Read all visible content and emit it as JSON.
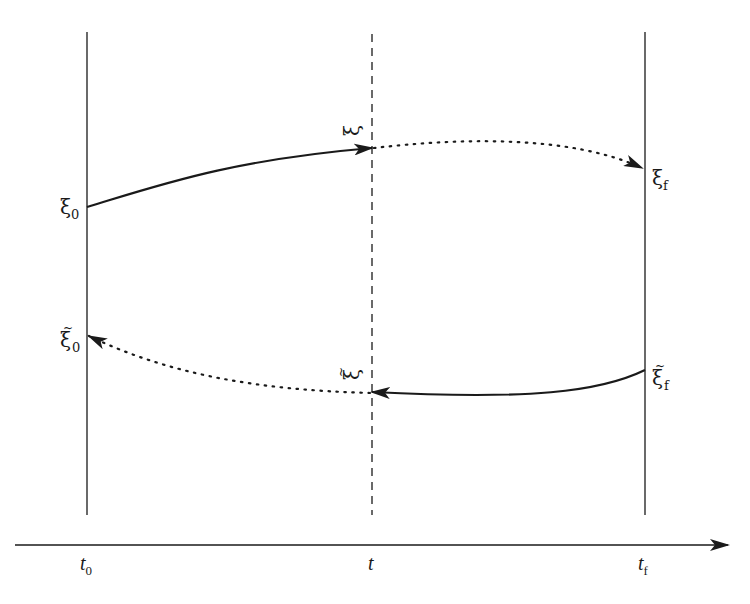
{
  "diagram": {
    "type": "forward-backward time evolution diagram",
    "time_axis": {
      "labels": {
        "start": "t",
        "start_sub": "0",
        "middle": "t",
        "end": "t",
        "end_sub": "f"
      }
    },
    "vertical_lines": [
      {
        "id": "t0-line",
        "style": "solid"
      },
      {
        "id": "t-line",
        "style": "dashed"
      },
      {
        "id": "tf-line",
        "style": "solid"
      }
    ],
    "state_labels": {
      "xi_0": {
        "symbol": "ξ",
        "sub": "0"
      },
      "xi_mid": {
        "symbol": "ξ"
      },
      "xi_f": {
        "symbol": "ξ",
        "sub": "f"
      },
      "xi_tilde_0": {
        "symbol": "ξ̃",
        "base": "ξ",
        "accent": "~",
        "sub": "0"
      },
      "xi_tilde_mid": {
        "symbol": "ξ̃",
        "base": "ξ",
        "accent": "~"
      },
      "xi_tilde_f": {
        "symbol": "ξ̃",
        "base": "ξ",
        "accent": "~",
        "sub": "f"
      }
    },
    "arrows": [
      {
        "from": "ξ0",
        "to": "ξ",
        "style": "solid",
        "direction": "forward"
      },
      {
        "from": "ξ",
        "to": "ξf",
        "style": "dotted",
        "direction": "forward"
      },
      {
        "from": "ξ̃f",
        "to": "ξ̃",
        "style": "solid",
        "direction": "backward"
      },
      {
        "from": "ξ̃",
        "to": "ξ̃0",
        "style": "dotted",
        "direction": "backward"
      }
    ],
    "colors": {
      "stroke": "#1a1a1a",
      "background": "#ffffff"
    }
  }
}
